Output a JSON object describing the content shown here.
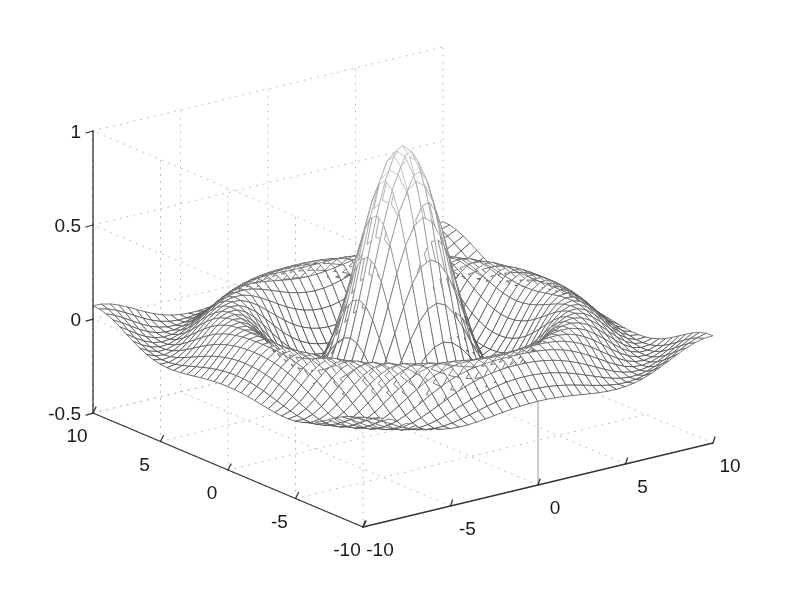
{
  "figure": {
    "background_color": "#ffffff",
    "line_color": "#444444",
    "axis_color": "#333333",
    "grid_color": "#bbbbbb",
    "text_color": "#1a1a1a",
    "width": 785,
    "height": 604
  },
  "chart_data": {
    "type": "surface",
    "render_style": "wireframe-mesh",
    "title": "",
    "xlabel": "",
    "ylabel": "",
    "zlabel": "",
    "function": "z = sin(r)/r,  r = sqrt(x^2 + y^2)",
    "function_name": "sinc",
    "xlim": [
      -10,
      10
    ],
    "ylim": [
      -10,
      10
    ],
    "zlim": [
      -0.5,
      1
    ],
    "x_ticks": [
      -10,
      -5,
      0,
      5,
      10
    ],
    "x_tick_labels": [
      "-10",
      "-5",
      "0",
      "5",
      "10"
    ],
    "y_ticks": [
      -10,
      -5,
      0,
      5,
      10
    ],
    "y_tick_labels": [
      "-10",
      "-5",
      "0",
      "5",
      "10"
    ],
    "z_ticks": [
      -0.5,
      0,
      0.5,
      1
    ],
    "z_tick_labels": [
      "-0.5",
      "0",
      "0.5",
      "1"
    ],
    "grid": true,
    "grid_style": "dotted",
    "legend": null,
    "mesh_rows": 41,
    "mesh_cols": 41,
    "peak_value": 1,
    "peak_location": [
      0,
      0
    ],
    "view_azimuth": -37.5,
    "view_elevation": 30,
    "colormap": "grayscale",
    "annotations": []
  },
  "axes": {
    "z_tick_labels": [
      {
        "text": "1",
        "value": 1
      },
      {
        "text": "0.5",
        "value": 0.5
      },
      {
        "text": "0",
        "value": 0
      },
      {
        "text": "-0.5",
        "value": -0.5
      }
    ],
    "y_tick_labels": [
      {
        "text": "10",
        "value": 10
      },
      {
        "text": "5",
        "value": 5
      },
      {
        "text": "0",
        "value": 0
      },
      {
        "text": "-5",
        "value": -5
      },
      {
        "text": "-10",
        "value": -10
      }
    ],
    "x_tick_labels": [
      {
        "text": "-10",
        "value": -10
      },
      {
        "text": "-5",
        "value": -5
      },
      {
        "text": "0",
        "value": 0
      },
      {
        "text": "5",
        "value": 5
      },
      {
        "text": "10",
        "value": 10
      }
    ]
  }
}
